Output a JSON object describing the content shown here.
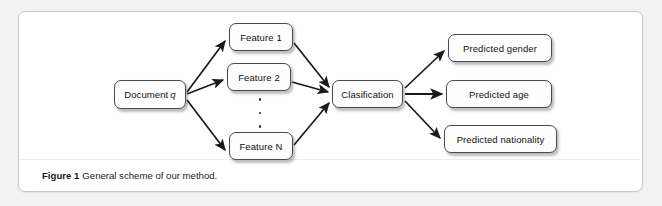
{
  "figure": {
    "caption_label": "Figure 1",
    "caption_text": "General scheme of our method."
  },
  "diagram": {
    "type": "flowchart",
    "nodes": [
      {
        "id": "document-q",
        "label": "Document ",
        "italic_suffix": "q"
      },
      {
        "id": "feature-1",
        "label": "Feature 1"
      },
      {
        "id": "feature-2",
        "label": "Feature 2"
      },
      {
        "id": "feature-n",
        "label": "Feature N"
      },
      {
        "id": "clasification",
        "label": "Clasification"
      },
      {
        "id": "predicted-gender",
        "label": "Predicted gender"
      },
      {
        "id": "predicted-age",
        "label": "Predicted age"
      },
      {
        "id": "predicted-nationality",
        "label": "Predicted nationality"
      }
    ],
    "ellipsis": "vertical-ellipsis",
    "edges": [
      {
        "from": "document-q",
        "to": "feature-1"
      },
      {
        "from": "document-q",
        "to": "feature-2"
      },
      {
        "from": "document-q",
        "to": "feature-n"
      },
      {
        "from": "feature-1",
        "to": "clasification"
      },
      {
        "from": "feature-2",
        "to": "clasification"
      },
      {
        "from": "feature-n",
        "to": "clasification"
      },
      {
        "from": "clasification",
        "to": "predicted-gender"
      },
      {
        "from": "clasification",
        "to": "predicted-age"
      },
      {
        "from": "clasification",
        "to": "predicted-nationality"
      }
    ]
  },
  "colors": {
    "page_background": "#f2f2f2",
    "panel_background": "#ffffff",
    "panel_border": "#c8c8c8",
    "node_border": "#4a4a4a",
    "node_fill": "#fdfdfd",
    "arrow": "#1a1a1a",
    "text": "#111111"
  }
}
